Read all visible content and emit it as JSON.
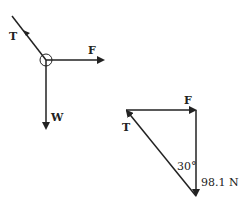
{
  "free_body_diagram": {
    "tension_label": "T",
    "force_label": "F",
    "weight_label": "W"
  },
  "vector_triangle": {
    "force_label": "F",
    "tension_label": "T",
    "angle_label": "30°",
    "weight_value_label": "98.1 N"
  },
  "colors": {
    "line": "#222222",
    "background": "#ffffff"
  }
}
